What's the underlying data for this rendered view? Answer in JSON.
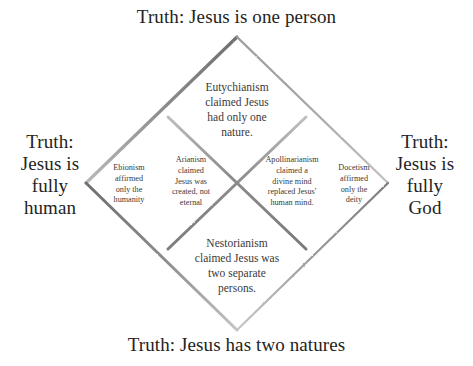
{
  "diagram": {
    "line_color": "#8d8d8d",
    "text_color": "#232323",
    "background_color": "#ffffff"
  },
  "truths": {
    "top": "Truth: Jesus is one person",
    "bottom": "Truth: Jesus has two natures",
    "left": "Truth:\nJesus is\nfully\nhuman",
    "right": "Truth:\nJesus is\nfully\nGod"
  },
  "heresies": {
    "eutychianism": "Eutychianism\nclaimed Jesus\nhad only one\nnature.",
    "nestorianism": "Nestorianism\nclaimed Jesus was\ntwo separate\npersons.",
    "ebionism": "Ebionism\naffirmed\nonly the\nhumanity",
    "arianism": "Arianism\nclaimed\nJesus was\ncreated, not\neternal",
    "apollinarianism": "Apollinarianism\nclaimed a\ndivine mind\nreplaced Jesus'\nhuman mind.",
    "docetism": "Docetism\naffirmed\nonly the\ndeity"
  },
  "geometry": {
    "outer_diamond": {
      "top": [
        237,
        37
      ],
      "right": [
        388,
        183
      ],
      "bottom": [
        237,
        330
      ],
      "left": [
        86,
        183
      ]
    },
    "inner_cross": {
      "center": [
        237,
        183
      ],
      "top_left_end": [
        168,
        117
      ],
      "top_right_end": [
        306,
        117
      ],
      "bottom_left_end": [
        168,
        249
      ],
      "bottom_right_end": [
        306,
        249
      ]
    }
  }
}
